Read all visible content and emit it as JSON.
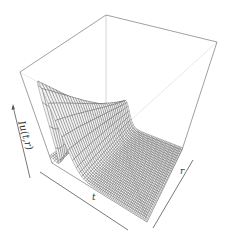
{
  "chart_data": {
    "type": "surface3d",
    "title": "",
    "xlabel": "t",
    "ylabel": "r",
    "zlabel": "Iu(t,r)",
    "axis_arrows": true,
    "tick_labels": false,
    "box": true,
    "colors": {
      "mesh": "#333333",
      "box": "#777777",
      "background": "#ffffff"
    }
  },
  "labels": {
    "z_axis": "Iu(t,r)",
    "x_axis": "t",
    "y_axis": "r"
  }
}
